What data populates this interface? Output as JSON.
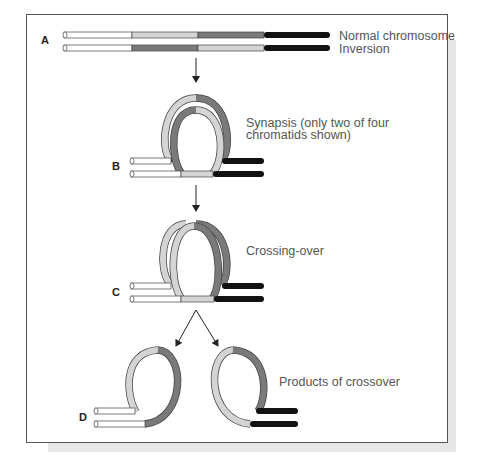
{
  "figure": {
    "stages": [
      {
        "id": "A",
        "label": "A",
        "captions": [
          "Normal chromosome",
          "Inversion"
        ]
      },
      {
        "id": "B",
        "label": "B",
        "captions": [
          "Synapsis (only two of four",
          "chromatids shown)"
        ]
      },
      {
        "id": "C",
        "label": "C",
        "captions": [
          "Crossing-over"
        ]
      },
      {
        "id": "D",
        "label": "D",
        "captions": [
          "Products of crossover"
        ]
      }
    ],
    "segment_colors": {
      "white": "#ffffff",
      "light_gray": "#d4d4d4",
      "dark_gray": "#7a7a7a",
      "black": "#111111"
    },
    "chromosome_order": {
      "normal": [
        "white",
        "light_gray",
        "dark_gray",
        "black"
      ],
      "inversion": [
        "white",
        "dark_gray",
        "light_gray",
        "black"
      ]
    }
  }
}
